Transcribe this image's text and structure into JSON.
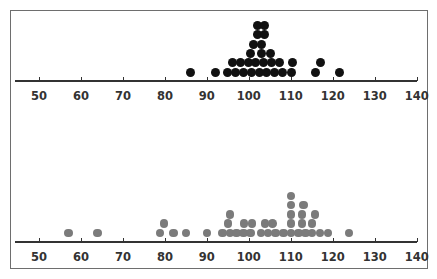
{
  "chart_data": [
    {
      "type": "scatter",
      "subtype": "dot_plot",
      "title": "",
      "xlabel": "",
      "ylabel": "",
      "xlim": [
        45,
        140
      ],
      "x_ticks": [
        50,
        60,
        70,
        80,
        90,
        100,
        110,
        120,
        130,
        140
      ],
      "grid": false,
      "dot_color": "#111111",
      "dots": [
        {
          "v": 86.0,
          "row": 1
        },
        {
          "v": 92.1,
          "row": 1
        },
        {
          "v": 95.0,
          "row": 1
        },
        {
          "v": 96.9,
          "row": 1
        },
        {
          "v": 98.8,
          "row": 1
        },
        {
          "v": 100.6,
          "row": 1
        },
        {
          "v": 102.5,
          "row": 1
        },
        {
          "v": 104.3,
          "row": 1
        },
        {
          "v": 106.2,
          "row": 1
        },
        {
          "v": 108.1,
          "row": 1
        },
        {
          "v": 110.1,
          "row": 1
        },
        {
          "v": 115.9,
          "row": 1
        },
        {
          "v": 121.7,
          "row": 1
        },
        {
          "v": 96.0,
          "row": 2
        },
        {
          "v": 98.0,
          "row": 2
        },
        {
          "v": 99.8,
          "row": 2
        },
        {
          "v": 101.7,
          "row": 2
        },
        {
          "v": 103.5,
          "row": 2
        },
        {
          "v": 105.3,
          "row": 2
        },
        {
          "v": 107.3,
          "row": 2
        },
        {
          "v": 110.3,
          "row": 2
        },
        {
          "v": 117.0,
          "row": 2
        },
        {
          "v": 100.5,
          "row": 3
        },
        {
          "v": 103.1,
          "row": 3
        },
        {
          "v": 105.2,
          "row": 3
        },
        {
          "v": 101.1,
          "row": 4
        },
        {
          "v": 103.1,
          "row": 4
        },
        {
          "v": 102.0,
          "row": 5
        },
        {
          "v": 103.8,
          "row": 5
        },
        {
          "v": 102.0,
          "row": 6
        },
        {
          "v": 103.8,
          "row": 6
        }
      ]
    },
    {
      "type": "scatter",
      "subtype": "dot_plot",
      "title": "",
      "xlabel": "",
      "ylabel": "",
      "xlim": [
        45,
        140
      ],
      "x_ticks": [
        50,
        60,
        70,
        80,
        90,
        100,
        110,
        120,
        130,
        140
      ],
      "grid": false,
      "dot_color": "#7b7b7b",
      "dots": [
        {
          "v": 57.0,
          "row": 1
        },
        {
          "v": 63.9,
          "row": 1
        },
        {
          "v": 78.8,
          "row": 1
        },
        {
          "v": 82.0,
          "row": 1
        },
        {
          "v": 85.0,
          "row": 1
        },
        {
          "v": 90.0,
          "row": 1
        },
        {
          "v": 93.7,
          "row": 1
        },
        {
          "v": 95.5,
          "row": 1
        },
        {
          "v": 97.1,
          "row": 1
        },
        {
          "v": 98.7,
          "row": 1
        },
        {
          "v": 100.4,
          "row": 1
        },
        {
          "v": 102.9,
          "row": 1
        },
        {
          "v": 104.6,
          "row": 1
        },
        {
          "v": 106.4,
          "row": 1
        },
        {
          "v": 108.2,
          "row": 1
        },
        {
          "v": 110.0,
          "row": 1
        },
        {
          "v": 111.8,
          "row": 1
        },
        {
          "v": 113.5,
          "row": 1
        },
        {
          "v": 115.1,
          "row": 1
        },
        {
          "v": 116.9,
          "row": 1
        },
        {
          "v": 118.9,
          "row": 1
        },
        {
          "v": 123.9,
          "row": 1
        },
        {
          "v": 79.8,
          "row": 2
        },
        {
          "v": 95.0,
          "row": 2
        },
        {
          "v": 98.9,
          "row": 2
        },
        {
          "v": 100.7,
          "row": 2
        },
        {
          "v": 103.8,
          "row": 2
        },
        {
          "v": 105.6,
          "row": 2
        },
        {
          "v": 110.0,
          "row": 2
        },
        {
          "v": 112.7,
          "row": 2
        },
        {
          "v": 115.0,
          "row": 2
        },
        {
          "v": 95.5,
          "row": 3
        },
        {
          "v": 110.0,
          "row": 3
        },
        {
          "v": 112.7,
          "row": 3
        },
        {
          "v": 115.8,
          "row": 3
        },
        {
          "v": 110.0,
          "row": 4
        },
        {
          "v": 113.0,
          "row": 4
        },
        {
          "v": 110.0,
          "row": 5
        }
      ]
    }
  ],
  "axis_labels": [
    "50",
    "60",
    "70",
    "80",
    "90",
    "100",
    "110",
    "120",
    "130",
    "140"
  ]
}
